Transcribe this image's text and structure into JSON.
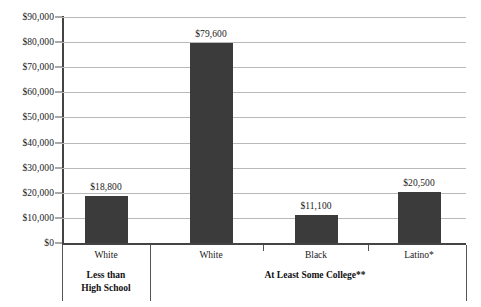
{
  "chart_data": {
    "type": "bar",
    "title": "",
    "subtitle": "",
    "xlabel": "",
    "ylabel": "",
    "ylim": [
      0,
      90000
    ],
    "grid": true,
    "legend": "none",
    "orientation": "vertical",
    "bar_color": "#3b3b3b",
    "categories": [
      "White",
      "White",
      "Black",
      "Latino*"
    ],
    "values": [
      18800,
      79600,
      11100,
      20500
    ],
    "data_labels": [
      "$18,800",
      "$79,600",
      "$11,100",
      "$20,500"
    ],
    "groups": [
      {
        "label": "Less than\nHigh School",
        "categories": [
          "White"
        ]
      },
      {
        "label": "At Least Some College**",
        "categories": [
          "White",
          "Black",
          "Latino*"
        ]
      }
    ],
    "y_ticks": [
      0,
      10000,
      20000,
      30000,
      40000,
      50000,
      60000,
      70000,
      80000,
      90000
    ],
    "y_tick_labels": [
      "$0",
      "$10,000",
      "$20,000",
      "$30,000",
      "$40,000",
      "$50,000",
      "$60,000",
      "$70,000",
      "$80,000",
      "$90,000"
    ]
  }
}
